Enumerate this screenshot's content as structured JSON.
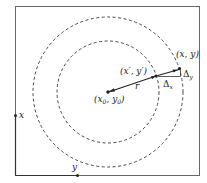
{
  "diagram": {
    "labels": {
      "center": "(x₀, y₀)",
      "inner_point": "(x′, y′)",
      "outer_point": "(x, y)",
      "radius": "r",
      "delta_x": "Δ",
      "delta_x_sub": "x",
      "delta_y": "Δ",
      "delta_y_sub": "y",
      "axis_x": "x",
      "axis_y": "y"
    },
    "colors": {
      "stroke": "#222222",
      "frame": "#555555",
      "background": "#ffffff"
    }
  }
}
